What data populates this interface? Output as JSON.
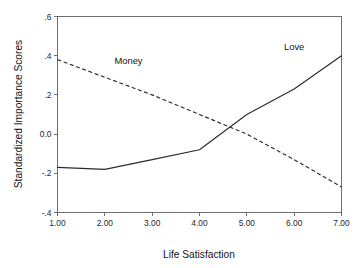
{
  "chart_data": {
    "type": "line",
    "title": "",
    "xlabel": "Life Satisfaction",
    "ylabel": "Standardized Importance Scores",
    "x": [
      1,
      2,
      3,
      4,
      5,
      6,
      7
    ],
    "xtick_labels": [
      "1.00",
      "2.00",
      "3.00",
      "4.00",
      "5.00",
      "6.00",
      "7.00"
    ],
    "ytick_labels": [
      ".6",
      ".4",
      ".2",
      "0.0",
      "-.2",
      "-.4"
    ],
    "ytick_values": [
      0.6,
      0.4,
      0.2,
      0.0,
      -0.2,
      -0.4
    ],
    "xlim": [
      1,
      7
    ],
    "ylim": [
      -0.4,
      0.6
    ],
    "grid": false,
    "legend_position": "inline-annotations",
    "series": [
      {
        "name": "Money",
        "style": "dashed",
        "label_x": 2.5,
        "label_y": 0.36,
        "values": [
          0.38,
          0.29,
          0.2,
          0.1,
          0.0,
          -0.13,
          -0.27
        ]
      },
      {
        "name": "Love",
        "style": "solid",
        "label_x": 6.0,
        "label_y": 0.43,
        "values": [
          -0.17,
          -0.18,
          -0.13,
          -0.08,
          0.1,
          0.23,
          0.4
        ]
      }
    ],
    "annotations": [
      {
        "text": "Money",
        "x": 2.5,
        "y": 0.36
      },
      {
        "text": "Love",
        "x": 6.0,
        "y": 0.43
      }
    ],
    "colors": {
      "line": "#2b2b2b",
      "axis": "#6e6e6e",
      "text": "#141414",
      "background": "#ffffff"
    }
  }
}
